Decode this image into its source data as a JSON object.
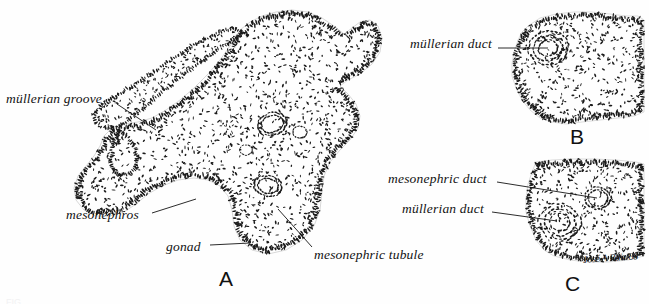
{
  "figure": {
    "kind": "histological-line-drawing",
    "panel_count": 3,
    "caption_cropped": "FIG."
  },
  "panels": [
    {
      "id": "A",
      "letter": "A",
      "letter_x": 219,
      "letter_y": 268
    },
    {
      "id": "B",
      "letter": "B",
      "letter_x": 570,
      "letter_y": 126
    },
    {
      "id": "C",
      "letter": "C",
      "letter_x": 565,
      "letter_y": 273
    }
  ],
  "labels": [
    {
      "id": "mullerian-groove",
      "text": "müllerian groove",
      "panel": "A",
      "x": 6,
      "y": 92,
      "leader": {
        "x1": 117,
        "y1": 104,
        "x2": 156,
        "y2": 130
      }
    },
    {
      "id": "mesonephros",
      "text": "mesonephros",
      "panel": "A",
      "x": 66,
      "y": 208,
      "leader": {
        "x1": 152,
        "y1": 213,
        "x2": 196,
        "y2": 199
      }
    },
    {
      "id": "gonad",
      "text": "gonad",
      "panel": "A",
      "x": 166,
      "y": 240,
      "leader": {
        "x1": 210,
        "y1": 245,
        "x2": 250,
        "y2": 243
      }
    },
    {
      "id": "mesonephric-tubule",
      "text": "mesonephric tubule",
      "panel": "A",
      "x": 314,
      "y": 248,
      "leader": {
        "x1": 312,
        "y1": 247,
        "x2": 278,
        "y2": 209
      }
    },
    {
      "id": "mullerian-duct-b",
      "text": "müllerian duct",
      "panel": "B",
      "x": 410,
      "y": 37,
      "leader": {
        "x1": 498,
        "y1": 48,
        "x2": 548,
        "y2": 48
      }
    },
    {
      "id": "mesonephric-duct-c",
      "text": "mesonephric duct",
      "panel": "C",
      "x": 388,
      "y": 172,
      "leader": {
        "x1": 497,
        "y1": 182,
        "x2": 597,
        "y2": 198
      }
    },
    {
      "id": "mullerian-duct-c",
      "text": "müllerian duct",
      "panel": "C",
      "x": 402,
      "y": 202,
      "leader": {
        "x1": 492,
        "y1": 212,
        "x2": 557,
        "y2": 221
      }
    }
  ],
  "signature": {
    "text": "José A Ruiz/88",
    "x": 583,
    "y": 252
  },
  "colors": {
    "ink": "#111111",
    "paper": "#fefefe",
    "stipple": "#1b1b1b",
    "leader": "#141414"
  }
}
